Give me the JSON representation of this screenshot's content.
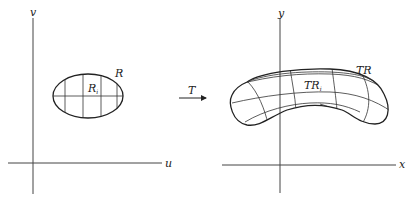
{
  "left_panel": {
    "axes": {
      "vertical_label": "v",
      "horizontal_label": "u"
    },
    "region_label": "R",
    "subregion_label": {
      "base": "R",
      "subscript": "i"
    }
  },
  "mapping": {
    "label": "T"
  },
  "right_panel": {
    "axes": {
      "vertical_label": "y",
      "horizontal_label": "x"
    },
    "region_label": "TR",
    "subregion_label": {
      "base": "TR",
      "subscript": "i"
    }
  }
}
